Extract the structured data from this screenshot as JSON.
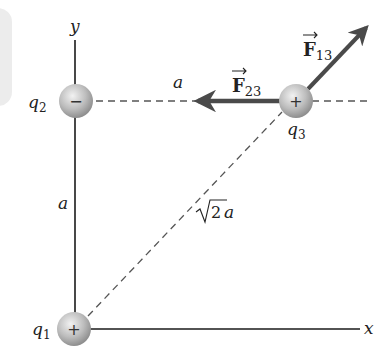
{
  "diagram": {
    "axes": {
      "x_label": "x",
      "y_label": "y"
    },
    "charges": [
      {
        "id": "q1",
        "symbol": "q",
        "subscript": "1",
        "sign": "+"
      },
      {
        "id": "q2",
        "symbol": "q",
        "subscript": "2",
        "sign": "−"
      },
      {
        "id": "q3",
        "symbol": "q",
        "subscript": "3",
        "sign": "+"
      }
    ],
    "distances": {
      "horizontal": "a",
      "vertical": "a",
      "diagonal_root": "2",
      "diagonal_var": "a"
    },
    "forces": [
      {
        "id": "F13",
        "symbol": "F",
        "subscript": "13"
      },
      {
        "id": "F23",
        "symbol": "F",
        "subscript": "23"
      }
    ],
    "colors": {
      "axis": "#1a1a1a",
      "arrow": "#4a4a4a",
      "dash": "#555555",
      "charge_fill": "#b8b8b8"
    }
  }
}
